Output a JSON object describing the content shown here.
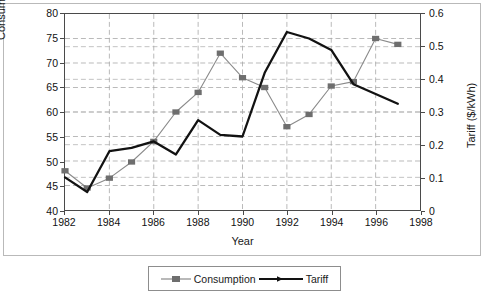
{
  "chart_data": {
    "type": "line",
    "title": "",
    "xlabel": "Year",
    "ylabel": "Consumption (GWh/year)",
    "y2label": "Tariff ($/kWh)",
    "x": [
      1982,
      1983,
      1984,
      1985,
      1986,
      1987,
      1988,
      1989,
      1990,
      1991,
      1992,
      1993,
      1994,
      1995,
      1996,
      1997
    ],
    "xlim": [
      1982,
      1998
    ],
    "xticks": [
      1982,
      1984,
      1986,
      1988,
      1990,
      1992,
      1994,
      1996,
      1998
    ],
    "xticklabels": [
      "1982",
      "1984",
      "1986",
      "1988",
      "1990",
      "1992",
      "1994",
      "1996",
      "1998"
    ],
    "ylim": [
      40,
      80
    ],
    "yticks": [
      40,
      45,
      50,
      55,
      60,
      65,
      70,
      75,
      80
    ],
    "yticklabels": [
      "40",
      "45",
      "50",
      "55",
      "60",
      "65",
      "70",
      "75",
      "80"
    ],
    "y2lim": [
      0,
      0.6
    ],
    "y2ticks": [
      0,
      0.1,
      0.2,
      0.3,
      0.4,
      0.5,
      0.6
    ],
    "y2ticklabels": [
      "0",
      "0.1",
      "0.2",
      "0.3",
      "0.4",
      "0.5",
      "0.6"
    ],
    "grid": true,
    "grid_style": "dashed",
    "legend_position": "bottom-center",
    "series": [
      {
        "name": "Consumption",
        "axis": "left",
        "color": "#8a8a8a",
        "marker": "square",
        "marker_color": "#6e6e6e",
        "values": [
          48.0,
          44.5,
          46.5,
          49.8,
          54.0,
          60.0,
          64.0,
          72.0,
          67.0,
          65.0,
          57.0,
          59.5,
          65.3,
          66.2,
          75.0,
          73.8
        ]
      },
      {
        "name": "Tariff",
        "axis": "right",
        "color": "#121212",
        "marker": "none",
        "marker_color": "#121212",
        "values": [
          0.1,
          0.055,
          0.18,
          0.19,
          0.21,
          0.17,
          0.275,
          0.23,
          0.225,
          0.42,
          0.545,
          0.525,
          0.49,
          0.385,
          0.355,
          0.325
        ]
      }
    ]
  },
  "legend": {
    "items": [
      {
        "label": "Consumption"
      },
      {
        "label": "Tariff"
      }
    ]
  }
}
